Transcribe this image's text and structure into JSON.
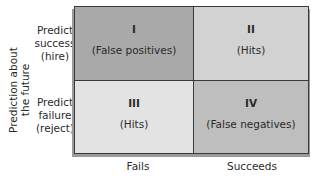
{
  "y_axis": {
    "label_line1": "Prediction about",
    "label_line2": "the future"
  },
  "rows": [
    {
      "line1": "Predict",
      "line2": "success",
      "line3": "(hire)"
    },
    {
      "line1": "Predict",
      "line2": "failure",
      "line3": "(reject)"
    }
  ],
  "x_axis": {
    "columns": [
      "Fails",
      "Succeeds"
    ]
  },
  "cells": [
    {
      "numeral": "I",
      "description": "(False positives)",
      "color": "#a9a9a9"
    },
    {
      "numeral": "II",
      "description": "(Hits)",
      "color": "#d2d2d2"
    },
    {
      "numeral": "III",
      "description": "(Hits)",
      "color": "#e3e3e3"
    },
    {
      "numeral": "IV",
      "description": "(False negatives)",
      "color": "#bebebe"
    }
  ]
}
